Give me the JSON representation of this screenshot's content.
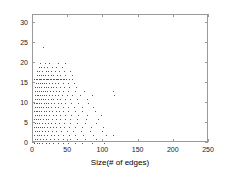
{
  "chart_data": {
    "type": "scatter",
    "title": "",
    "xlabel": "Size(# of edges)",
    "ylabel": "Error",
    "xlim": [
      0,
      250
    ],
    "ylim": [
      0,
      32
    ],
    "xticks": [
      0,
      50,
      100,
      150,
      200,
      250
    ],
    "yticks": [
      0,
      5,
      10,
      15,
      20,
      25,
      30
    ],
    "grid": false,
    "legend": null,
    "marker": "dot",
    "marker_color": "#555555",
    "frame_color": "#9a9a9a",
    "points": [
      [
        14,
        24
      ],
      [
        10,
        20
      ],
      [
        17,
        20
      ],
      [
        23,
        20
      ],
      [
        35,
        20
      ],
      [
        45,
        20
      ],
      [
        8,
        19
      ],
      [
        12,
        19
      ],
      [
        16,
        19
      ],
      [
        20,
        19
      ],
      [
        27,
        19
      ],
      [
        33,
        19
      ],
      [
        41,
        19
      ],
      [
        6,
        18
      ],
      [
        9,
        18
      ],
      [
        13,
        18
      ],
      [
        18,
        18
      ],
      [
        22,
        18
      ],
      [
        26,
        18
      ],
      [
        31,
        18
      ],
      [
        37,
        18
      ],
      [
        44,
        18
      ],
      [
        52,
        18
      ],
      [
        5,
        17
      ],
      [
        8,
        17
      ],
      [
        11,
        17
      ],
      [
        14,
        17
      ],
      [
        17,
        17
      ],
      [
        21,
        17
      ],
      [
        25,
        17
      ],
      [
        29,
        17
      ],
      [
        34,
        17
      ],
      [
        39,
        17
      ],
      [
        46,
        17
      ],
      [
        55,
        17
      ],
      [
        2,
        16
      ],
      [
        4,
        16
      ],
      [
        6,
        16
      ],
      [
        8,
        16
      ],
      [
        10,
        16
      ],
      [
        12,
        16
      ],
      [
        14,
        16
      ],
      [
        16,
        16
      ],
      [
        18,
        16
      ],
      [
        20,
        16
      ],
      [
        22,
        16
      ],
      [
        24,
        16
      ],
      [
        26,
        16
      ],
      [
        28,
        16
      ],
      [
        30,
        16
      ],
      [
        32,
        16
      ],
      [
        34,
        16
      ],
      [
        36,
        16
      ],
      [
        38,
        16
      ],
      [
        40,
        16
      ],
      [
        42,
        16
      ],
      [
        44,
        16
      ],
      [
        47,
        16
      ],
      [
        51,
        16
      ],
      [
        56,
        16
      ],
      [
        4,
        15
      ],
      [
        7,
        15
      ],
      [
        10,
        15
      ],
      [
        13,
        15
      ],
      [
        16,
        15
      ],
      [
        19,
        15
      ],
      [
        23,
        15
      ],
      [
        27,
        15
      ],
      [
        31,
        15
      ],
      [
        36,
        15
      ],
      [
        42,
        15
      ],
      [
        49,
        15
      ],
      [
        58,
        15
      ],
      [
        3,
        14
      ],
      [
        6,
        14
      ],
      [
        9,
        14
      ],
      [
        12,
        14
      ],
      [
        15,
        14
      ],
      [
        18,
        14
      ],
      [
        21,
        14
      ],
      [
        25,
        14
      ],
      [
        29,
        14
      ],
      [
        33,
        14
      ],
      [
        38,
        14
      ],
      [
        44,
        14
      ],
      [
        51,
        14
      ],
      [
        61,
        14
      ],
      [
        3,
        13
      ],
      [
        5,
        13
      ],
      [
        8,
        13
      ],
      [
        11,
        13
      ],
      [
        14,
        13
      ],
      [
        17,
        13
      ],
      [
        20,
        13
      ],
      [
        24,
        13
      ],
      [
        28,
        13
      ],
      [
        32,
        13
      ],
      [
        37,
        13
      ],
      [
        43,
        13
      ],
      [
        50,
        13
      ],
      [
        59,
        13
      ],
      [
        72,
        13
      ],
      [
        113,
        13
      ],
      [
        3,
        12
      ],
      [
        5,
        12
      ],
      [
        7,
        12
      ],
      [
        10,
        12
      ],
      [
        13,
        12
      ],
      [
        16,
        12
      ],
      [
        19,
        12
      ],
      [
        23,
        12
      ],
      [
        27,
        12
      ],
      [
        31,
        12
      ],
      [
        36,
        12
      ],
      [
        41,
        12
      ],
      [
        48,
        12
      ],
      [
        56,
        12
      ],
      [
        67,
        12
      ],
      [
        84,
        12
      ],
      [
        115,
        12
      ],
      [
        3,
        11
      ],
      [
        5,
        11
      ],
      [
        8,
        11
      ],
      [
        11,
        11
      ],
      [
        14,
        11
      ],
      [
        17,
        11
      ],
      [
        21,
        11
      ],
      [
        25,
        11
      ],
      [
        29,
        11
      ],
      [
        34,
        11
      ],
      [
        39,
        11
      ],
      [
        45,
        11
      ],
      [
        53,
        11
      ],
      [
        63,
        11
      ],
      [
        76,
        11
      ],
      [
        2,
        10
      ],
      [
        4,
        10
      ],
      [
        6,
        10
      ],
      [
        9,
        10
      ],
      [
        12,
        10
      ],
      [
        15,
        10
      ],
      [
        18,
        10
      ],
      [
        22,
        10
      ],
      [
        26,
        10
      ],
      [
        30,
        10
      ],
      [
        35,
        10
      ],
      [
        40,
        10
      ],
      [
        46,
        10
      ],
      [
        54,
        10
      ],
      [
        64,
        10
      ],
      [
        78,
        10
      ],
      [
        3,
        9
      ],
      [
        5,
        9
      ],
      [
        8,
        9
      ],
      [
        11,
        9
      ],
      [
        14,
        9
      ],
      [
        18,
        9
      ],
      [
        22,
        9
      ],
      [
        26,
        9
      ],
      [
        31,
        9
      ],
      [
        36,
        9
      ],
      [
        42,
        9
      ],
      [
        49,
        9
      ],
      [
        58,
        9
      ],
      [
        69,
        9
      ],
      [
        85,
        9
      ],
      [
        2,
        8
      ],
      [
        4,
        8
      ],
      [
        6,
        8
      ],
      [
        9,
        8
      ],
      [
        12,
        8
      ],
      [
        15,
        8
      ],
      [
        19,
        8
      ],
      [
        23,
        8
      ],
      [
        27,
        8
      ],
      [
        32,
        8
      ],
      [
        37,
        8
      ],
      [
        43,
        8
      ],
      [
        50,
        8
      ],
      [
        59,
        8
      ],
      [
        70,
        8
      ],
      [
        88,
        8
      ],
      [
        3,
        7
      ],
      [
        5,
        7
      ],
      [
        8,
        7
      ],
      [
        11,
        7
      ],
      [
        15,
        7
      ],
      [
        19,
        7
      ],
      [
        23,
        7
      ],
      [
        28,
        7
      ],
      [
        33,
        7
      ],
      [
        39,
        7
      ],
      [
        46,
        7
      ],
      [
        54,
        7
      ],
      [
        64,
        7
      ],
      [
        77,
        7
      ],
      [
        96,
        7
      ],
      [
        2,
        6
      ],
      [
        4,
        6
      ],
      [
        7,
        6
      ],
      [
        10,
        6
      ],
      [
        14,
        6
      ],
      [
        18,
        6
      ],
      [
        22,
        6
      ],
      [
        27,
        6
      ],
      [
        32,
        6
      ],
      [
        38,
        6
      ],
      [
        45,
        6
      ],
      [
        53,
        6
      ],
      [
        63,
        6
      ],
      [
        75,
        6
      ],
      [
        92,
        6
      ],
      [
        3,
        5
      ],
      [
        6,
        5
      ],
      [
        9,
        5
      ],
      [
        13,
        5
      ],
      [
        17,
        5
      ],
      [
        21,
        5
      ],
      [
        26,
        5
      ],
      [
        31,
        5
      ],
      [
        37,
        5
      ],
      [
        44,
        5
      ],
      [
        52,
        5
      ],
      [
        62,
        5
      ],
      [
        74,
        5
      ],
      [
        90,
        5
      ],
      [
        2,
        4
      ],
      [
        4,
        4
      ],
      [
        7,
        4
      ],
      [
        10,
        4
      ],
      [
        13,
        4
      ],
      [
        16,
        4
      ],
      [
        20,
        4
      ],
      [
        24,
        4
      ],
      [
        28,
        4
      ],
      [
        33,
        4
      ],
      [
        38,
        4
      ],
      [
        44,
        4
      ],
      [
        51,
        4
      ],
      [
        59,
        4
      ],
      [
        69,
        4
      ],
      [
        82,
        4
      ],
      [
        99,
        4
      ],
      [
        3,
        3
      ],
      [
        6,
        3
      ],
      [
        9,
        3
      ],
      [
        13,
        3
      ],
      [
        17,
        3
      ],
      [
        22,
        3
      ],
      [
        27,
        3
      ],
      [
        33,
        3
      ],
      [
        40,
        3
      ],
      [
        48,
        3
      ],
      [
        57,
        3
      ],
      [
        68,
        3
      ],
      [
        81,
        3
      ],
      [
        98,
        3
      ],
      [
        2,
        2
      ],
      [
        5,
        2
      ],
      [
        8,
        2
      ],
      [
        12,
        2
      ],
      [
        16,
        2
      ],
      [
        20,
        2
      ],
      [
        25,
        2
      ],
      [
        30,
        2
      ],
      [
        36,
        2
      ],
      [
        43,
        2
      ],
      [
        51,
        2
      ],
      [
        60,
        2
      ],
      [
        71,
        2
      ],
      [
        85,
        2
      ],
      [
        104,
        2
      ],
      [
        113,
        2
      ],
      [
        3,
        1
      ],
      [
        6,
        1
      ],
      [
        10,
        1
      ],
      [
        14,
        1
      ],
      [
        19,
        1
      ],
      [
        24,
        1
      ],
      [
        30,
        1
      ],
      [
        36,
        1
      ],
      [
        43,
        1
      ],
      [
        52,
        1
      ],
      [
        62,
        1
      ],
      [
        74,
        1
      ],
      [
        89,
        1
      ],
      [
        2,
        0
      ],
      [
        5,
        0
      ],
      [
        9,
        0
      ],
      [
        13,
        0
      ],
      [
        18,
        0
      ],
      [
        23,
        0
      ],
      [
        29,
        0
      ],
      [
        35,
        0
      ],
      [
        42,
        0
      ],
      [
        50,
        0
      ],
      [
        59,
        0
      ],
      [
        70,
        0
      ],
      [
        84,
        0
      ],
      [
        101,
        0
      ]
    ]
  }
}
